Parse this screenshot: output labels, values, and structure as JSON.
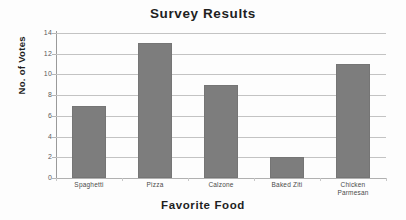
{
  "chart_data": {
    "type": "bar",
    "title": "Survey Results",
    "xlabel": "Favorite Food",
    "ylabel": "No. of Votes",
    "categories": [
      "Spaghetti",
      "Pizza",
      "Calzone",
      "Baked Ziti",
      "Chicken Parmesan"
    ],
    "values": [
      7,
      13,
      9,
      2,
      11
    ],
    "ylim": [
      0,
      14
    ],
    "yticks": [
      0,
      2,
      4,
      6,
      8,
      10,
      12,
      14
    ],
    "ytick_labels": [
      "0",
      "2",
      "4",
      "6",
      "8",
      "10",
      "12",
      "14"
    ],
    "grid": true,
    "legend": false,
    "bar_color": "#7d7d7d",
    "gridline_color": "#c3c3c3",
    "axis_color": "#9a9a9a",
    "text_color": "#1f1f1f",
    "background": "#fdfdfd"
  },
  "category_lines": [
    [
      "Spaghetti"
    ],
    [
      "Pizza"
    ],
    [
      "Calzone"
    ],
    [
      "Baked Ziti"
    ],
    [
      "Chicken",
      "Parmesan"
    ]
  ]
}
